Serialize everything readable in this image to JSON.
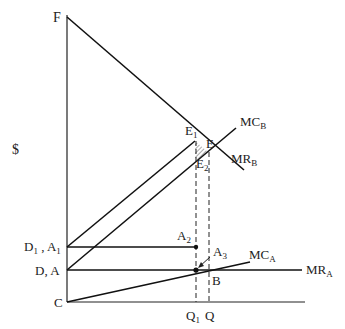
{
  "diagram": {
    "y_axis_label": "$",
    "points": {
      "F": "F",
      "E1": {
        "main": "E",
        "sub": "1"
      },
      "E": "E",
      "E2": {
        "main": "E",
        "sub": "2"
      },
      "A2": {
        "main": "A",
        "sub": "2"
      },
      "A3": {
        "main": "A",
        "sub": "3"
      },
      "B": "B",
      "C": "C"
    },
    "axis_labels": {
      "D1A1": {
        "a": "D",
        "asub": "1",
        "sep": " , ",
        "b": "A",
        "bsub": "1"
      },
      "DA": "D, A",
      "Q1": {
        "main": "Q",
        "sub": "1"
      },
      "Q": "Q"
    },
    "curves": {
      "MCB": {
        "main": "MC",
        "sub": "B"
      },
      "MRB": {
        "main": "MR",
        "sub": "B"
      },
      "MCA": {
        "main": "MC",
        "sub": "A"
      },
      "MRA": {
        "main": "MR",
        "sub": "A"
      }
    },
    "colors": {
      "line": "#111111",
      "hatch": "#555555"
    }
  }
}
